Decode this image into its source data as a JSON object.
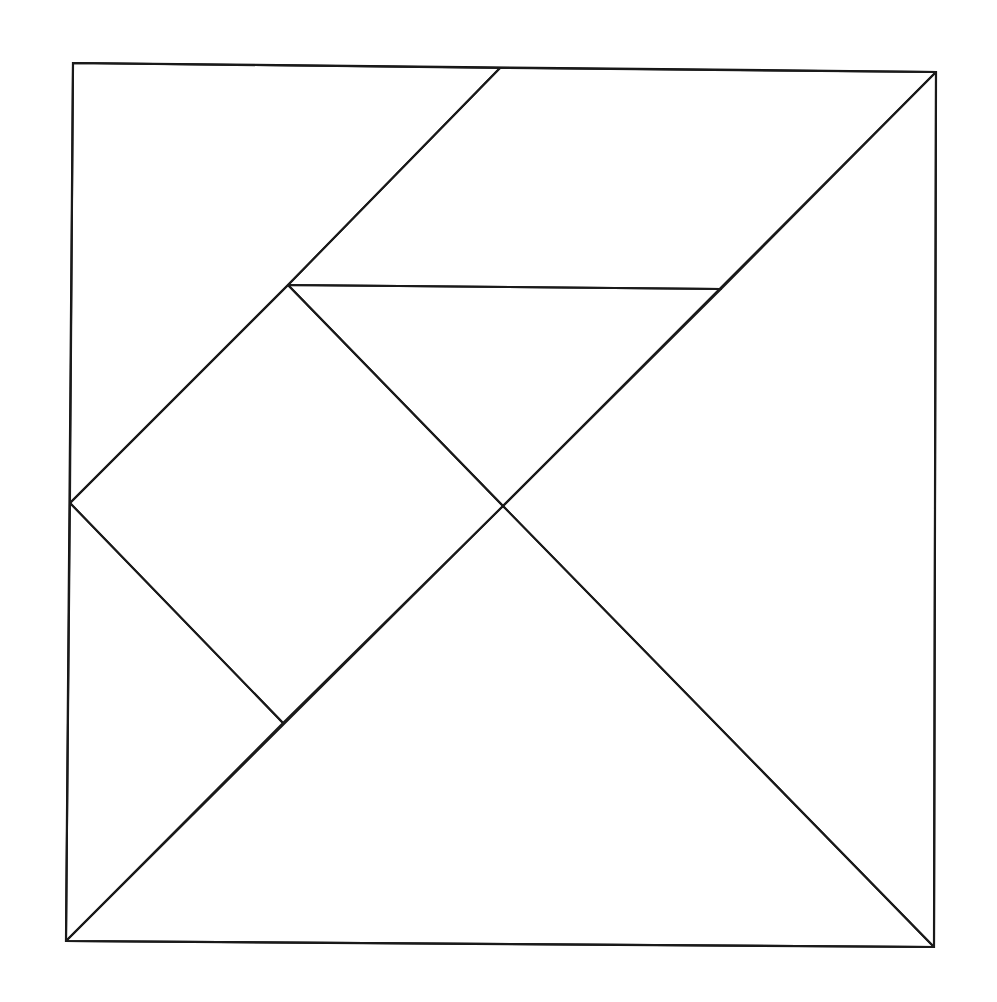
{
  "diagram": {
    "type": "tangram",
    "colors": {
      "stroke": "#1a1a1a",
      "background": "#ffffff"
    },
    "frame": [
      [
        73,
        63
      ],
      [
        936,
        72
      ],
      [
        934,
        947
      ],
      [
        66,
        941
      ]
    ],
    "pieces": [
      {
        "name": "large-triangle-bottom",
        "points": [
          [
            66,
            941
          ],
          [
            934,
            947
          ],
          [
            503,
            506
          ]
        ]
      },
      {
        "name": "large-triangle-right",
        "points": [
          [
            936,
            72
          ],
          [
            934,
            947
          ],
          [
            503,
            506
          ]
        ]
      },
      {
        "name": "parallelogram-top",
        "points": [
          [
            500,
            68
          ],
          [
            936,
            72
          ],
          [
            721,
            289
          ],
          [
            288,
            285
          ]
        ]
      },
      {
        "name": "triangle-top-left",
        "points": [
          [
            73,
            63
          ],
          [
            500,
            68
          ],
          [
            288,
            285
          ],
          [
            70,
            503
          ]
        ]
      },
      {
        "name": "small-triangle-middle",
        "points": [
          [
            288,
            285
          ],
          [
            721,
            289
          ],
          [
            503,
            506
          ]
        ]
      },
      {
        "name": "square-middle",
        "points": [
          [
            70,
            503
          ],
          [
            288,
            285
          ],
          [
            503,
            506
          ],
          [
            283,
            723
          ]
        ]
      },
      {
        "name": "small-triangle-left",
        "points": [
          [
            70,
            503
          ],
          [
            283,
            723
          ],
          [
            66,
            941
          ]
        ]
      }
    ]
  }
}
